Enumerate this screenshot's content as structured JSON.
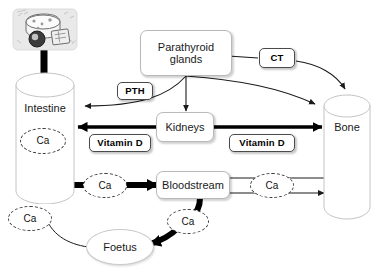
{
  "diagram": {
    "background_color": "#ffffff",
    "nodes": {
      "food_image": {
        "label": "dietary-calcium-foods",
        "alt": "dairy foods cheese and milk illustration"
      },
      "intestine": {
        "label": "Intestine"
      },
      "parathyroid": {
        "label": "Parathyroid glands"
      },
      "kidneys": {
        "label": "Kidneys"
      },
      "bone": {
        "label": "Bone"
      },
      "bloodstream": {
        "label": "Bloodstream"
      },
      "foetus": {
        "label": "Foetus"
      }
    },
    "hormone_tags": {
      "pth": "PTH",
      "ct": "CT",
      "vitamin_d_left": "Vitamin D",
      "vitamin_d_right": "Vitamin D"
    },
    "calcium_nodes": [
      {
        "id": "ca-intestine",
        "label": "Ca"
      },
      {
        "id": "ca-absorbed",
        "label": "Ca"
      },
      {
        "id": "ca-bone-exchange",
        "label": "Ca"
      },
      {
        "id": "ca-foetal",
        "label": "Ca"
      },
      {
        "id": "ca-excreted",
        "label": "Ca"
      }
    ],
    "colors": {
      "stroke_thin": "#1a1a1a",
      "stroke_thick": "#000000",
      "box_border": "#b9b9b9",
      "tag_border": "#4a4a4a",
      "dashed_border": "#3a3a3a",
      "text": "#1a1a1a"
    }
  }
}
